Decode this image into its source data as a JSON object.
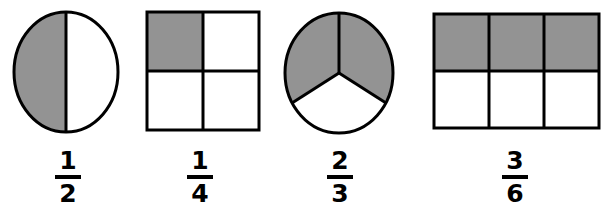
{
  "image": {
    "title": "Fraction models worksheet illustration",
    "background_color": "#ffffff",
    "shade_color": "#939393",
    "outline_color": "#000000",
    "width": 608,
    "height": 208
  },
  "figures": [
    {
      "id": "half-circle",
      "shape_name": "circle",
      "parts_total": 2,
      "parts_shaded": 1,
      "division": "vertical-diameter",
      "fraction": {
        "numerator": "1",
        "denominator": "2"
      }
    },
    {
      "id": "quarter-square",
      "shape_name": "square-grid",
      "parts_total": 4,
      "parts_shaded": 1,
      "division": "2x2-grid",
      "fraction": {
        "numerator": "1",
        "denominator": "4"
      }
    },
    {
      "id": "two-thirds-circle",
      "shape_name": "circle",
      "parts_total": 3,
      "parts_shaded": 2,
      "division": "three-sectors",
      "fraction": {
        "numerator": "2",
        "denominator": "3"
      }
    },
    {
      "id": "three-sixths-rectangle",
      "shape_name": "rectangle-grid",
      "parts_total": 6,
      "parts_shaded": 3,
      "division": "3x2-grid",
      "fraction": {
        "numerator": "3",
        "denominator": "6"
      }
    }
  ]
}
